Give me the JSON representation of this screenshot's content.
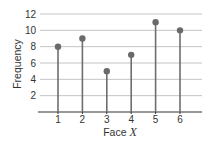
{
  "chart_data": {
    "type": "stem",
    "title": "",
    "xlabel": "Face",
    "xlabel_var": "X",
    "ylabel": "Frequency",
    "categories": [
      "1",
      "2",
      "3",
      "4",
      "5",
      "6"
    ],
    "values": [
      8,
      9,
      5,
      7,
      11,
      10
    ],
    "yticks": [
      2,
      4,
      6,
      8,
      10,
      12
    ],
    "ylim": [
      0,
      12
    ],
    "grid": true,
    "legend": null,
    "colors": {
      "stem": "#6e6e6e",
      "marker": "#6a6a6a",
      "grid": "#c4c4c4",
      "axis": "#333333",
      "text": "#333333"
    }
  }
}
